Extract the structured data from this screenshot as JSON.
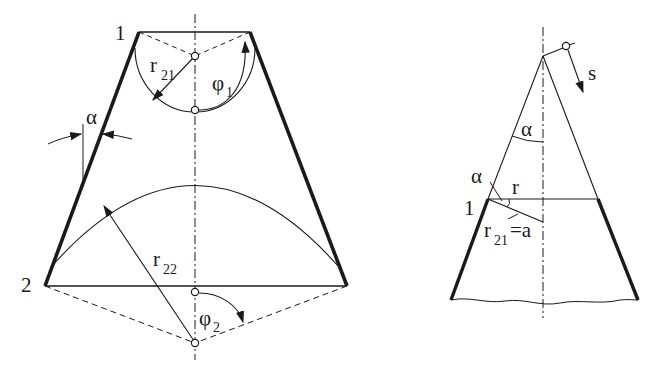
{
  "figure": {
    "left": {
      "labels": {
        "point1": "1",
        "point2": "2",
        "alpha": "α",
        "r21": "r",
        "r21_sub": "21",
        "phi1": "φ",
        "phi1_sub": "1",
        "r22": "r",
        "r22_sub": "22",
        "phi2": "φ",
        "phi2_sub": "2"
      }
    },
    "right": {
      "labels": {
        "s": "s",
        "alpha_apex": "α",
        "alpha_edge": "α",
        "r": "r",
        "point1": "1",
        "r21": "r",
        "r21_sub": "21",
        "r21_eq": "=a"
      }
    },
    "colors": {
      "ink": "#1a1a1a",
      "background": "#ffffff"
    }
  }
}
